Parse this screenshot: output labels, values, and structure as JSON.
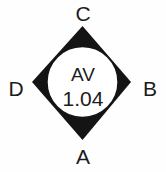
{
  "figure": {
    "name": "aortic-valve-diamond-diagram",
    "shape": "diamond-with-inscribed-circle",
    "colors": {
      "fill": "#141414",
      "circle": "#ffffff",
      "text": "#1c1c1c",
      "background": "#fefefe"
    },
    "center": {
      "label": "AV",
      "value": "1.04"
    },
    "vertices": [
      {
        "id": "C",
        "label": "C",
        "position": "top"
      },
      {
        "id": "B",
        "label": "B",
        "position": "right"
      },
      {
        "id": "A",
        "label": "A",
        "position": "bottom"
      },
      {
        "id": "D",
        "label": "D",
        "position": "left"
      }
    ]
  }
}
